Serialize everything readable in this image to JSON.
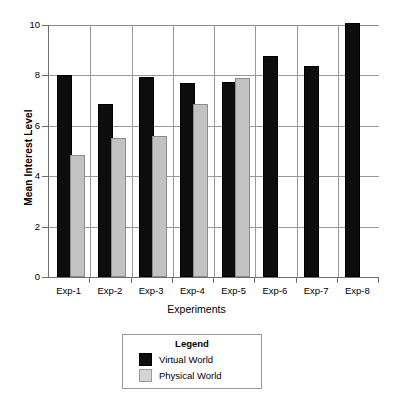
{
  "chart_data": {
    "type": "bar",
    "title": "",
    "xlabel": "Experiments",
    "ylabel": "Mean Interest Level",
    "categories": [
      "Exp-1",
      "Exp-2",
      "Exp-3",
      "Exp-4",
      "Exp-5",
      "Exp-6",
      "Exp-7",
      "Exp-8"
    ],
    "series": [
      {
        "name": "Virtual World",
        "color": "#0d0d0d",
        "values": [
          7.95,
          6.8,
          7.85,
          7.6,
          7.65,
          8.7,
          8.3,
          10.0
        ]
      },
      {
        "name": "Physical World",
        "color": "#c2c2c2",
        "values": [
          4.75,
          5.45,
          5.5,
          6.8,
          7.8,
          null,
          null,
          null
        ]
      }
    ],
    "ylim": [
      0,
      10
    ],
    "yticks": [
      0,
      2,
      4,
      6,
      8,
      10
    ],
    "ytick_labels": [
      "0",
      "2",
      "4",
      "6",
      "8",
      "10"
    ],
    "grid": "horizontal-and-vertical",
    "legend_position": "below-plot-center"
  },
  "legend": {
    "title": "Legend",
    "entries": [
      {
        "label": "Virtual World",
        "swatch": "virtual"
      },
      {
        "label": "Physical World",
        "swatch": "physical"
      }
    ]
  }
}
